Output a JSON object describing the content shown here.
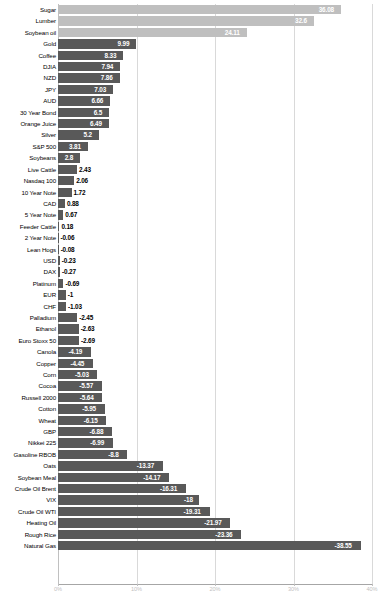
{
  "chart_data": {
    "type": "bar",
    "orientation": "horizontal",
    "title": "",
    "subtitle": "",
    "xlabel": "",
    "ylabel": "",
    "grid": true,
    "legend": null,
    "xlim": [
      -40,
      40
    ],
    "xticks": [
      "0%",
      "10%",
      "20%",
      "30%",
      "40%"
    ],
    "xtick_values": [
      0,
      10,
      20,
      30,
      40
    ],
    "value_suffix": "%",
    "categories": [
      "Sugar",
      "Lumber",
      "Soybean oil",
      "Gold",
      "Coffee",
      "DJIA",
      "NZD",
      "JPY",
      "AUD",
      "30 Year Bond",
      "Orange Juice",
      "Silver",
      "S&P 500",
      "Soybeans",
      "Live Cattle",
      "Nasdaq 100",
      "10 Year Note",
      "CAD",
      "5 Year Note",
      "Feeder Cattle",
      "2 Year Note",
      "Lean Hogs",
      "USD",
      "DAX",
      "Platinum",
      "EUR",
      "CHF",
      "Palladium",
      "Ethanol",
      "Euro Stoxx 50",
      "Canola",
      "Copper",
      "Corn",
      "Cocoa",
      "Russell 2000",
      "Cotton",
      "Wheat",
      "GBP",
      "Nikkei 225",
      "Gasoline RBOB",
      "Oats",
      "Soybean Meal",
      "Crude Oil Brent",
      "VIX",
      "Crude Oil WTI",
      "Heating Oil",
      "Rough Rice",
      "Natural Gas"
    ],
    "values": [
      36.08,
      32.6,
      24.11,
      9.99,
      8.33,
      7.94,
      7.86,
      7.03,
      6.66,
      6.5,
      6.49,
      5.2,
      3.81,
      2.8,
      2.43,
      2.06,
      1.72,
      0.88,
      0.67,
      0.18,
      -0.06,
      -0.08,
      -0.23,
      -0.27,
      -0.69,
      -1,
      -1.03,
      -2.45,
      -2.63,
      -2.69,
      -4.19,
      -4.45,
      -5.03,
      -5.57,
      -5.64,
      -5.95,
      -6.15,
      -6.88,
      -6.99,
      -8.8,
      -13.37,
      -14.17,
      -16.31,
      -18,
      -19.31,
      -21.97,
      -23.36,
      -38.55
    ],
    "value_labels": [
      "36.08",
      "32.6",
      "24.11",
      "9.99",
      "8.33",
      "7.94",
      "7.86",
      "7.03",
      "6.66",
      "6.5",
      "6.49",
      "5.2",
      "3.81",
      "2.8",
      "2.43",
      "2.06",
      "1.72",
      "0.88",
      "0.67",
      "0.18",
      "-0.06",
      "-0.08",
      "-0.23",
      "-0.27",
      "-0.69",
      "-1",
      "-1.03",
      "-2.45",
      "-2.63",
      "-2.69",
      "-4.19",
      "-4.45",
      "-5.03",
      "-5.57",
      "-5.64",
      "-5.95",
      "-6.15",
      "-6.88",
      "-6.99",
      "-8.8",
      "-13.37",
      "-14.17",
      "-16.31",
      "-18",
      "-19.31",
      "-21.97",
      "-23.36",
      "-38.55"
    ],
    "highlight_indices": [
      0,
      1,
      2
    ],
    "colors": {
      "bar_default": "#595959",
      "bar_highlight": "#bfbfbf",
      "gridline": "#d9d9d9",
      "axis": "#a6a6a6",
      "label_text": "#000000",
      "value_text_inside": "#ffffff",
      "tick_text": "#bfbfbf",
      "background": "#ffffff"
    }
  }
}
